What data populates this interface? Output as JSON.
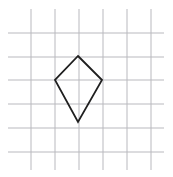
{
  "figure": {
    "canvas": {
      "width": 173,
      "height": 177,
      "background": "#ffffff"
    },
    "grid": {
      "name": "square-grid",
      "spacing": 24,
      "stroke_color": "#b9b9be",
      "stroke_width": 1,
      "vertical_lines": {
        "count": 6,
        "x_positions": [
          31,
          55,
          79,
          103,
          127,
          151
        ],
        "y_start": 9,
        "y_end": 170
      },
      "horizontal_lines": {
        "count": 6,
        "y_positions": [
          33,
          57,
          80,
          104,
          128,
          152
        ],
        "x_start": 8,
        "x_end": 164
      }
    },
    "shape": {
      "name": "kite",
      "type": "polygon",
      "sides": 4,
      "stroke_color": "#1f1f1f",
      "stroke_width": 1.8,
      "fill": "none",
      "vertices": [
        {
          "label": "top",
          "x": 78,
          "y": 56
        },
        {
          "label": "right",
          "x": 102,
          "y": 80
        },
        {
          "label": "bottom",
          "x": 78,
          "y": 122
        },
        {
          "label": "left",
          "x": 55,
          "y": 80
        }
      ],
      "points_attr": "78,56 102,80 78,122 55,80"
    }
  }
}
